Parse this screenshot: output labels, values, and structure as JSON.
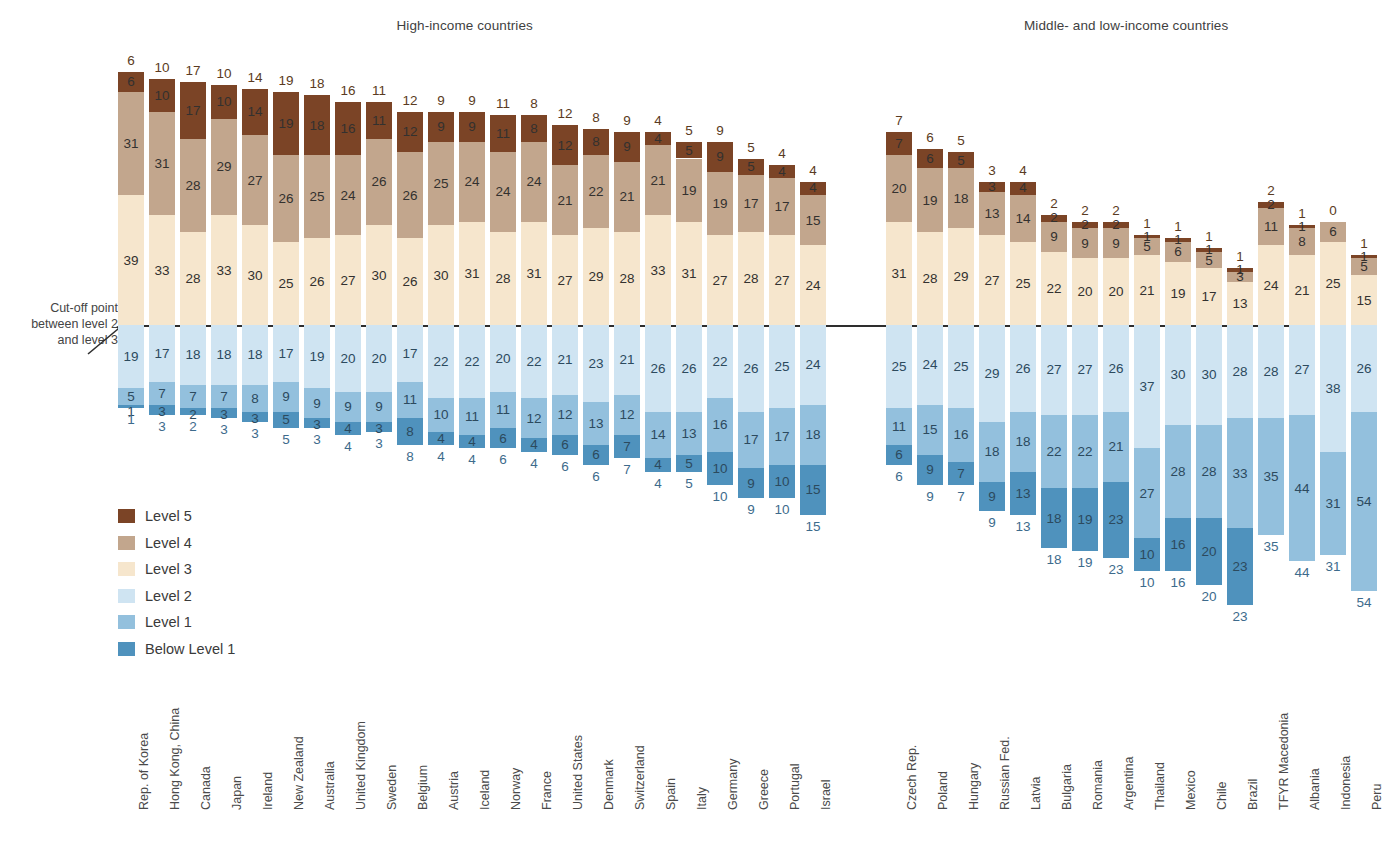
{
  "groups": {
    "high_income": "High-income countries",
    "middle_low_income": "Middle- and low-income countries"
  },
  "cutoff_note": {
    "line1": "Cut-off point",
    "line2": "between level 2",
    "line3": "and level 3"
  },
  "legend": {
    "items": [
      {
        "key": "l5",
        "label": "Level 5",
        "color": "#7b4426"
      },
      {
        "key": "l4",
        "label": "Level 4",
        "color": "#c2a68d"
      },
      {
        "key": "l3",
        "label": "Level 3",
        "color": "#f6e6cd"
      },
      {
        "key": "l2",
        "label": "Level 2",
        "color": "#cfe4f2"
      },
      {
        "key": "l1",
        "label": "Level 1",
        "color": "#93c0dd"
      },
      {
        "key": "l0",
        "label": "Below Level 1",
        "color": "#4f92bd"
      }
    ]
  },
  "chart_data": {
    "type": "bar",
    "subtype": "diverging-stacked-bar",
    "title": "",
    "xlabel": "",
    "ylabel": "",
    "grid": false,
    "legend_position": "inner-left",
    "baseline_note": "Cut-off point between level 2 and level 3",
    "series": [
      {
        "name": "Level 5",
        "color": "#7b4426"
      },
      {
        "name": "Level 4",
        "color": "#c2a68d"
      },
      {
        "name": "Level 3",
        "color": "#f6e6cd"
      },
      {
        "name": "Level 2",
        "color": "#cfe4f2"
      },
      {
        "name": "Level 1",
        "color": "#93c0dd"
      },
      {
        "name": "Below Level 1",
        "color": "#4f92bd"
      }
    ],
    "groups": [
      {
        "name": "High-income countries",
        "categories": [
          "Rep. of Korea",
          "Hong Kong, China",
          "Canada",
          "Japan",
          "Ireland",
          "New Zealand",
          "Australia",
          "United Kingdom",
          "Sweden",
          "Belgium",
          "Austria",
          "Iceland",
          "Norway",
          "France",
          "United States",
          "Denmark",
          "Switzerland",
          "Spain",
          "Italy",
          "Germany",
          "Greece",
          "Portugal",
          "Israel"
        ],
        "values": {
          "Level 5": [
            6,
            10,
            17,
            10,
            14,
            19,
            18,
            16,
            11,
            12,
            9,
            9,
            11,
            8,
            12,
            8,
            9,
            4,
            5,
            9,
            5,
            4,
            4
          ],
          "Level 4": [
            31,
            31,
            28,
            29,
            27,
            26,
            25,
            24,
            26,
            26,
            25,
            24,
            24,
            24,
            21,
            22,
            21,
            21,
            19,
            19,
            17,
            17,
            15
          ],
          "Level 3": [
            39,
            33,
            28,
            33,
            30,
            25,
            26,
            27,
            30,
            26,
            30,
            31,
            28,
            31,
            27,
            29,
            28,
            33,
            31,
            27,
            28,
            27,
            24
          ],
          "Level 2": [
            19,
            17,
            18,
            18,
            18,
            17,
            19,
            20,
            20,
            17,
            22,
            22,
            20,
            22,
            21,
            23,
            21,
            26,
            26,
            22,
            26,
            25,
            24
          ],
          "Level 1": [
            5,
            7,
            7,
            7,
            8,
            9,
            9,
            9,
            9,
            11,
            10,
            11,
            11,
            12,
            12,
            13,
            12,
            14,
            13,
            16,
            17,
            17,
            18
          ],
          "Below Level 1": [
            1,
            3,
            2,
            3,
            3,
            5,
            3,
            4,
            3,
            8,
            4,
            4,
            6,
            4,
            6,
            6,
            7,
            4,
            5,
            10,
            9,
            10,
            15
          ]
        }
      },
      {
        "name": "Middle- and low-income countries",
        "categories": [
          "Czech Rep.",
          "Poland",
          "Hungary",
          "Russian Fed.",
          "Latvia",
          "Bulgaria",
          "Romania",
          "Argentina",
          "Thailand",
          "Mexico",
          "Chile",
          "Brazil",
          "TFYR Macedonia",
          "Albania",
          "Indonesia",
          "Peru"
        ],
        "values": {
          "Level 5": [
            7,
            6,
            5,
            3,
            4,
            2,
            2,
            2,
            1,
            1,
            1,
            1,
            2,
            1,
            0,
            1
          ],
          "Level 4": [
            20,
            19,
            18,
            13,
            14,
            9,
            9,
            9,
            5,
            6,
            5,
            3,
            11,
            8,
            6,
            5
          ],
          "Level 3": [
            31,
            28,
            29,
            27,
            25,
            22,
            20,
            20,
            21,
            19,
            17,
            13,
            24,
            21,
            25,
            15
          ],
          "Level 2": [
            25,
            24,
            25,
            29,
            26,
            27,
            27,
            26,
            37,
            30,
            30,
            28,
            28,
            27,
            38,
            26
          ],
          "Level 1": [
            11,
            15,
            16,
            18,
            18,
            22,
            22,
            21,
            27,
            28,
            28,
            33,
            35,
            44,
            31,
            54
          ],
          "Below Level 1": [
            6,
            9,
            7,
            9,
            13,
            18,
            19,
            23,
            10,
            16,
            20,
            23,
            0,
            0,
            0,
            0
          ]
        }
      }
    ]
  }
}
